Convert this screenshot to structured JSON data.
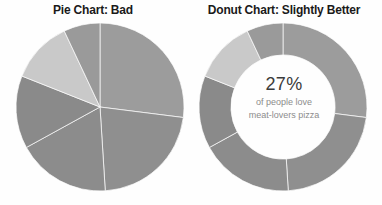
{
  "page": {
    "background": "#fefefe",
    "width": 382,
    "height": 205
  },
  "pie": {
    "title": "Pie Chart: Bad"
  },
  "donut": {
    "title": "Donut Chart: Slightly Better",
    "center_percent": "27%",
    "center_line1": "of people love",
    "center_line2": "meat-lovers pizza"
  },
  "chart_data": [
    {
      "type": "pie",
      "title": "Pie Chart: Bad",
      "categories": [
        "Slice A",
        "Slice B",
        "Slice C",
        "Slice D",
        "Slice E",
        "Slice F"
      ],
      "values": [
        27,
        22,
        18,
        14,
        12,
        7
      ],
      "colors": [
        "#9c9c9c",
        "#8f8f8f",
        "#8c8c8c",
        "#8a8a8a",
        "#c9c9c9",
        "#9a9a9a"
      ],
      "start_angle": 0,
      "legend": "none",
      "labels_shown": false,
      "xlabel": "",
      "ylabel": ""
    },
    {
      "type": "pie",
      "subtype": "donut",
      "title": "Donut Chart: Slightly Better",
      "categories": [
        "Slice A",
        "Slice B",
        "Slice C",
        "Slice D",
        "Slice E",
        "Slice F"
      ],
      "values": [
        27,
        22,
        18,
        14,
        12,
        7
      ],
      "colors": [
        "#9c9c9c",
        "#8f8f8f",
        "#8c8c8c",
        "#8a8a8a",
        "#c9c9c9",
        "#9a9a9a"
      ],
      "start_angle": 0,
      "inner_radius_ratio": 0.62,
      "center_label": "27%",
      "center_sublabel_1": "of people love",
      "center_sublabel_2": "meat-lovers pizza",
      "legend": "none",
      "labels_shown": false,
      "xlabel": "",
      "ylabel": ""
    }
  ]
}
